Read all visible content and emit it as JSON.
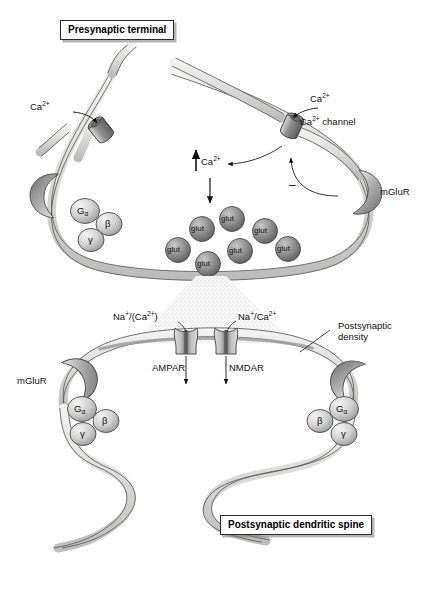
{
  "figure": {
    "type": "biological-diagram"
  },
  "boxes": {
    "presynaptic": "Presynaptic terminal",
    "postsynaptic": "Postsynaptic dendritic spine"
  },
  "presynaptic": {
    "ca_label_left": "Ca",
    "ca_sup_left": "2+",
    "ca_label_right": "Ca",
    "ca_sup_right": "2+",
    "ca_channel_label": "Ca",
    "ca_channel_sup": "2+",
    "ca_channel_word": "channel",
    "ca_influx_label": "Ca",
    "ca_influx_sup": "2+",
    "mglur_label": "mGluR",
    "inhibition_sign": "–",
    "gprotein": {
      "alpha": "G",
      "alpha_sub": "α",
      "beta": "β",
      "gamma": "γ"
    },
    "vesicle_label": "glut",
    "vesicle_count": 7
  },
  "postsynaptic": {
    "ampar_label": "AMPAR",
    "nmdar_label": "NMDAR",
    "ampar_ions": "Na",
    "ampar_ions_sup": "+",
    "ampar_ions_rest": "/(Ca",
    "ampar_ions_sup2": "2+",
    "ampar_ions_close": ")",
    "nmdar_ions": "Na",
    "nmdar_ions_sup": "+",
    "nmdar_ions_rest": "/Ca",
    "nmdar_ions_sup2": "2+",
    "density_label_line1": "Postsynaptic",
    "density_label_line2": "density",
    "mglur_label": "mGluR",
    "gprotein": {
      "alpha": "G",
      "alpha_sub": "α",
      "beta": "β",
      "gamma": "γ"
    }
  },
  "colors": {
    "membrane_fill": "#dededc",
    "membrane_stroke": "#5a5a5a",
    "vesicle_fill": "#8c8c8c",
    "receptor_dark": "#6f6f6f",
    "gprotein_fill": "#cfcfcf",
    "cleft_stipple": "#b9b9b9",
    "line": "#1a1a1a"
  }
}
